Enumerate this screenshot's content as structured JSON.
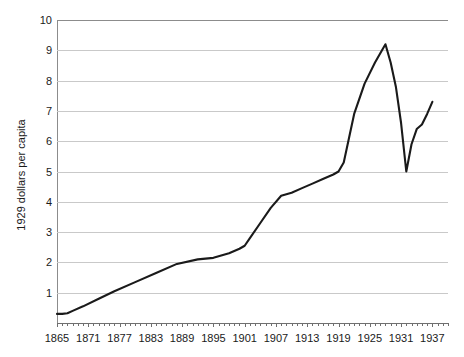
{
  "chart_data": {
    "type": "line",
    "title": "",
    "subtitle": "",
    "xlabel": "",
    "ylabel": "1929 dollars per capita",
    "xlim": [
      1865,
      1940
    ],
    "ylim": [
      0,
      10
    ],
    "grid": true,
    "grid_axis": "y",
    "legend": false,
    "legend_position": "none",
    "line_color": "#1a1a1a",
    "grid_color": "#c9c9c9",
    "axis_color": "#6f6f6f",
    "y_ticks": [
      1,
      2,
      3,
      4,
      5,
      6,
      7,
      8,
      9,
      10
    ],
    "y_tick_labels": [
      "1",
      "2",
      "3",
      "4",
      "5",
      "6",
      "7",
      "8",
      "9",
      "10"
    ],
    "x_ticks": [
      1865,
      1871,
      1877,
      1883,
      1889,
      1895,
      1901,
      1907,
      1913,
      1919,
      1925,
      1931,
      1937
    ],
    "x_tick_labels": [
      "1865",
      "1871",
      "1877",
      "1883",
      "1889",
      "1895",
      "1901",
      "1907",
      "1913",
      "1919",
      "1925",
      "1931",
      "1937"
    ],
    "x_minor_tick_step": 1,
    "series": [
      {
        "name": "1929 dollars per capita",
        "x": [
          1865,
          1866,
          1867,
          1868,
          1870,
          1873,
          1876,
          1880,
          1884,
          1888,
          1892,
          1895,
          1898,
          1900,
          1901,
          1902,
          1904,
          1906,
          1908,
          1910,
          1912,
          1914,
          1916,
          1918,
          1919,
          1920,
          1921,
          1922,
          1924,
          1926,
          1928,
          1929,
          1930,
          1931,
          1932,
          1933,
          1934,
          1935,
          1936,
          1937
        ],
        "values": [
          0.3,
          0.3,
          0.32,
          0.4,
          0.55,
          0.8,
          1.05,
          1.35,
          1.65,
          1.95,
          2.1,
          2.15,
          2.3,
          2.45,
          2.55,
          2.8,
          3.3,
          3.8,
          4.2,
          4.3,
          4.45,
          4.6,
          4.75,
          4.9,
          5.0,
          5.3,
          6.1,
          6.9,
          7.9,
          8.6,
          9.2,
          8.6,
          7.8,
          6.6,
          5.0,
          5.9,
          6.4,
          6.55,
          6.9,
          7.3
        ]
      }
    ]
  }
}
